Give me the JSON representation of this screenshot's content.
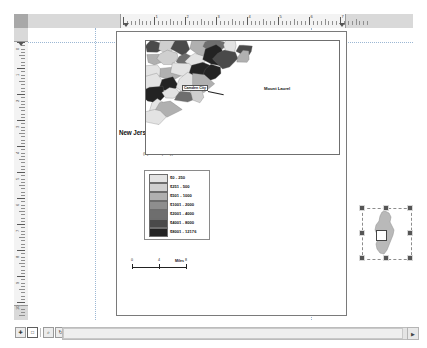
{
  "app": {
    "view": "layout-view"
  },
  "rulers": {
    "horizontal_labels": [
      "1",
      "2",
      "3",
      "4",
      "5",
      "6",
      "7"
    ],
    "vertical_labels": [
      "0",
      "1",
      "2",
      "3",
      "4",
      "5",
      "6",
      "7",
      "8",
      "9",
      "10"
    ],
    "units": "inches"
  },
  "layout": {
    "title": "New Jersey Per Capita Tax , 2001",
    "subtitle": "(by municipality)"
  },
  "legend": {
    "items": [
      {
        "label": "$0 - 250",
        "color": "#e3e3e3"
      },
      {
        "label": "$251 - 500",
        "color": "#cfcfcf"
      },
      {
        "label": "$501 - 1000",
        "color": "#b0b0b0"
      },
      {
        "label": "$1001 - 2000",
        "color": "#8e8e8e"
      },
      {
        "label": "$2001 - 4000",
        "color": "#6e6e6e"
      },
      {
        "label": "$4001 - 8000",
        "color": "#4a4a4a"
      },
      {
        "label": "$8001 - 12176",
        "color": "#232323"
      }
    ]
  },
  "scalebar": {
    "ticks": [
      "0",
      "4",
      "8"
    ],
    "unit": "Miles"
  },
  "map": {
    "labels": [
      {
        "text": "Mount Laurel",
        "x": 118,
        "y": 47
      }
    ],
    "callouts": [
      {
        "text": "Camden City",
        "x": 52,
        "y": 48
      }
    ]
  },
  "inset": {
    "name": "new-jersey-overview",
    "selected": true,
    "handle_count": 8
  },
  "statusbar": {
    "tools": [
      {
        "name": "pan-tool",
        "glyph": "✚"
      },
      {
        "name": "select-tool",
        "glyph": "□"
      },
      {
        "name": "zoom-tool",
        "glyph": "⌕"
      },
      {
        "name": "refresh-tool",
        "glyph": "↻"
      }
    ],
    "scroll_left_glyph": "◀",
    "scroll_right_glyph": "▶"
  },
  "colors": {
    "page_background": "#ffffff",
    "ruler_background": "#d9d9d9",
    "ruler_active": "#f3f3f3",
    "guide": "#9bb7d4",
    "frame_border": "#6f6f6f"
  }
}
